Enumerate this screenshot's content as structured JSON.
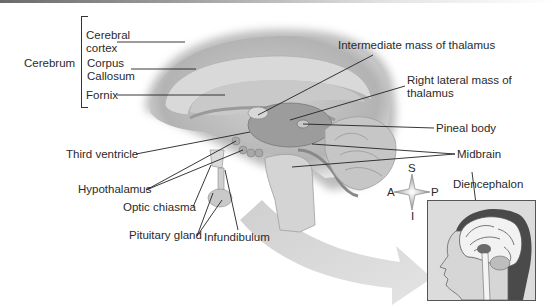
{
  "figure": {
    "type": "anatomical-diagram",
    "group_label": "Cerebrum",
    "labels": {
      "cerebral_cortex": "Cerebral cortex",
      "corpus_callosum": "Corpus Callosum",
      "fornix": "Fornix",
      "intermediate_mass": "Intermediate mass of thalamus",
      "right_lateral_mass": "Right lateral mass of thalamus",
      "pineal_body": "Pineal body",
      "midbrain": "Midbrain",
      "third_ventricle": "Third ventricle",
      "hypothalamus": "Hypothalamus",
      "optic_chiasma": "Optic chiasma",
      "pituitary_gland": "Pituitary gland",
      "infundibulum": "Infundibulum",
      "diencephalon": "Diencephalon"
    },
    "label_lines": {
      "cerebral_cortex_1": "Cerebral",
      "cerebral_cortex_2": "cortex",
      "corpus_callosum_1": "Corpus",
      "corpus_callosum_2": "Callosum",
      "right_lateral_mass_1": "Right lateral mass of",
      "right_lateral_mass_2": "thalamus"
    },
    "orientation": {
      "superior": "S",
      "inferior": "I",
      "anterior": "A",
      "posterior": "P"
    },
    "colors": {
      "brain_outer": "#bdbdbd",
      "brain_inner": "#d6d6d6",
      "thalamus": "#9e9e9e",
      "arrow": "#dcdcdc",
      "inset_hair": "#4a4a4a",
      "line": "#222222"
    }
  }
}
